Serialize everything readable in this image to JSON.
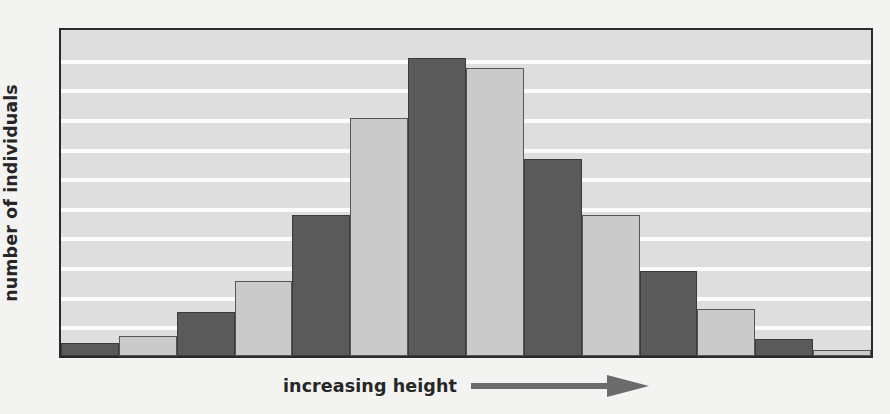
{
  "figure": {
    "background_color": "#f3f3f1",
    "plot_background_color": "#dedede",
    "frame_color": "#2b2b2b",
    "gridline_color": "#fbfbfb"
  },
  "axes": {
    "y_label": "number of individuals",
    "x_label": "increasing height",
    "x_arrow_icon": "arrow-right-icon",
    "x_arrow_color": "#6b6b6b"
  },
  "chart_data": {
    "type": "bar",
    "title": "",
    "xlabel": "increasing height",
    "ylabel": "number of individuals",
    "categories": [
      "1",
      "2",
      "3",
      "4",
      "5",
      "6",
      "7",
      "8",
      "9",
      "10",
      "11",
      "12",
      "13",
      "14"
    ],
    "values": [
      0.4,
      0.65,
      1.4,
      2.4,
      4.5,
      7.6,
      9.5,
      9.2,
      6.3,
      4.5,
      2.7,
      1.5,
      0.55,
      0.2
    ],
    "bar_colors": [
      "dark",
      "light",
      "dark",
      "light",
      "dark",
      "light",
      "dark",
      "light",
      "dark",
      "light",
      "dark",
      "light",
      "dark",
      "light"
    ],
    "colors": {
      "dark": "#5a5a5a",
      "light": "#cacaca"
    },
    "ylim": [
      0,
      10.4
    ],
    "xlim": [
      0,
      14
    ],
    "gridlines": 10,
    "grid": true,
    "legend": false,
    "tick_labels": {
      "x": [],
      "y": []
    }
  }
}
